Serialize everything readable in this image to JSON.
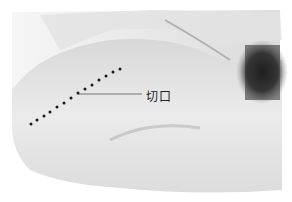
{
  "figure": {
    "annotation": {
      "label": "切口",
      "meaning": "incision"
    },
    "colors": {
      "background": "#ffffff",
      "skin_light": "#e6e6e6",
      "skin_mid": "#cfcfcf",
      "shadow": "#1e1e1e",
      "dots": "#1a1a1a",
      "leader_line": "#555555"
    }
  }
}
